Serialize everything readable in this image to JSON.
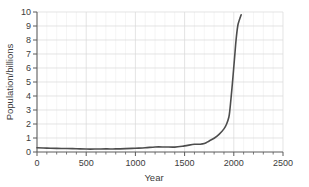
{
  "chart_data": {
    "type": "line",
    "title": "",
    "xlabel": "Year",
    "ylabel": "Population/billions",
    "xlim": [
      0,
      2500
    ],
    "ylim": [
      0,
      10
    ],
    "xticks": [
      0,
      500,
      1000,
      1500,
      2000,
      2500
    ],
    "xtick_labels": [
      "0",
      "500",
      "1000",
      "1500",
      "2000",
      "2500"
    ],
    "x_minor_tick_step": 100,
    "yticks": [
      0,
      1,
      2,
      3,
      4,
      5,
      6,
      7,
      8,
      9,
      10
    ],
    "ytick_labels": [
      "0",
      "1",
      "2",
      "3",
      "4",
      "5",
      "6",
      "7",
      "8",
      "9",
      "10"
    ],
    "grid": true,
    "legend": "none",
    "series": [
      {
        "name": "World population",
        "color": "#4d4d4d",
        "x": [
          0,
          100,
          200,
          300,
          400,
          500,
          600,
          700,
          800,
          900,
          1000,
          1100,
          1200,
          1300,
          1400,
          1500,
          1600,
          1650,
          1700,
          1750,
          1800,
          1850,
          1900,
          1927,
          1950,
          1960,
          1974,
          1987,
          1999,
          2011,
          2023,
          2040,
          2055,
          2065,
          2075
        ],
        "y": [
          0.3,
          0.28,
          0.26,
          0.25,
          0.23,
          0.21,
          0.21,
          0.22,
          0.22,
          0.24,
          0.27,
          0.3,
          0.36,
          0.36,
          0.35,
          0.44,
          0.55,
          0.55,
          0.6,
          0.79,
          0.98,
          1.26,
          1.65,
          2.0,
          2.5,
          3.0,
          4.0,
          5.0,
          6.0,
          7.0,
          8.0,
          9.0,
          9.4,
          9.6,
          9.8
        ]
      }
    ]
  },
  "axis": {
    "ylabel_text": "Population/billions",
    "xlabel_text": "Year"
  }
}
